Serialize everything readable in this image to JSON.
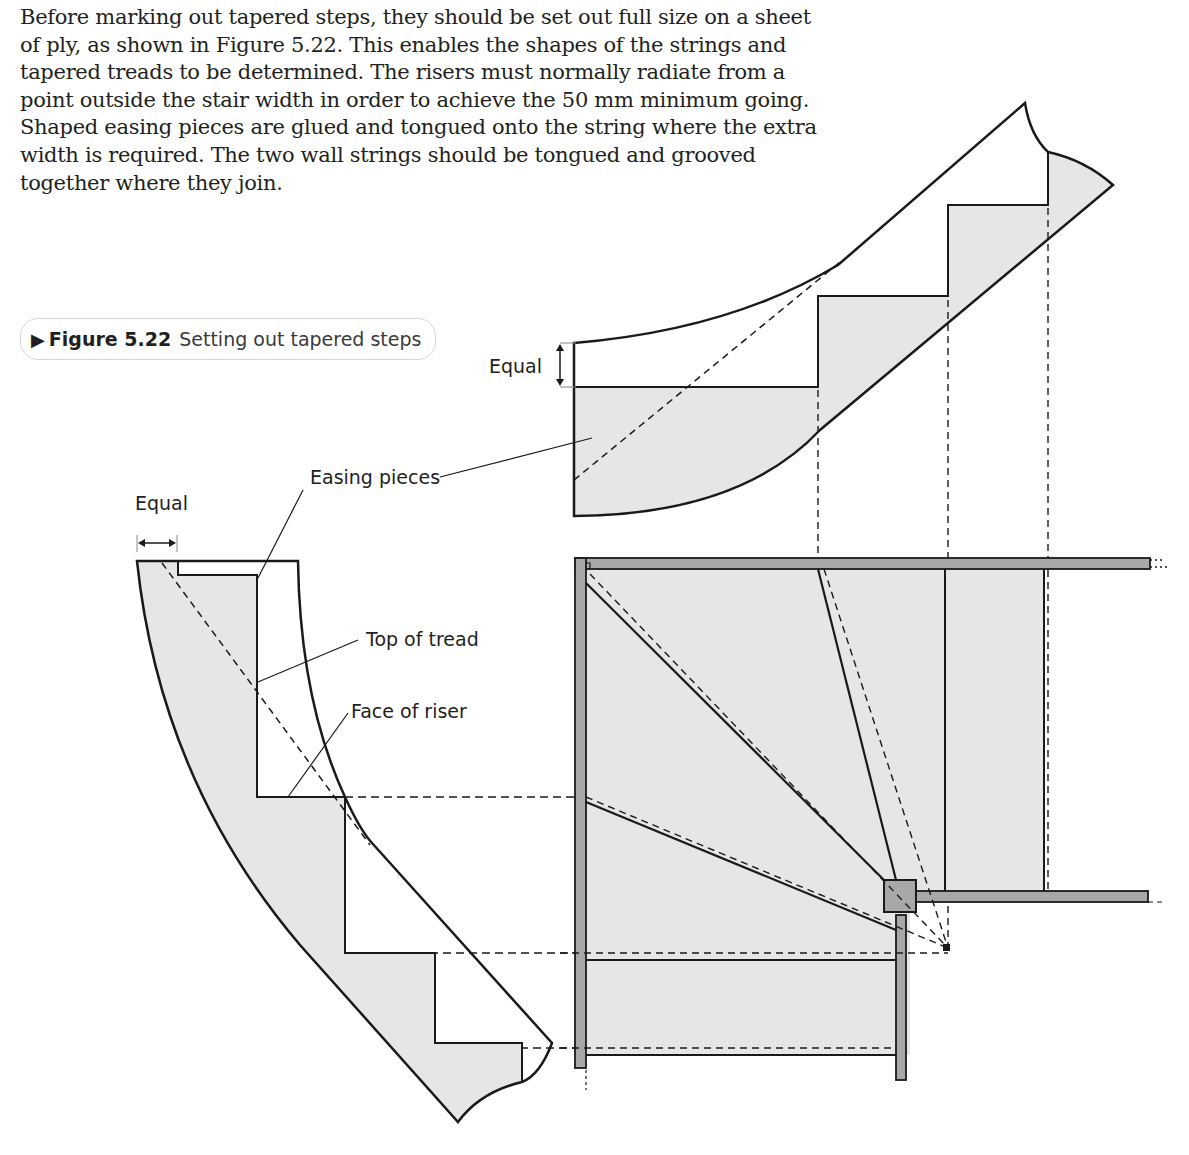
{
  "paragraph": {
    "lines": [
      "Before marking out tapered steps, they should be set out full size on a sheet",
      "of ply, as shown in Figure 5.22. This enables the shapes of the strings and",
      "tapered treads to be determined. The risers must normally radiate from a",
      "point outside the stair width in order to achieve the 50 mm minimum going.",
      "Shaped easing pieces are glued and tongued onto the string where the extra",
      "width is required. The two wall strings should be tongued and grooved",
      "together where they join."
    ]
  },
  "figure": {
    "arrow_icon": "▶",
    "number": "Figure 5.22",
    "title": "Setting out tapered steps",
    "labels": {
      "equal_top": "Equal",
      "equal_left": "Equal",
      "easing_pieces": "Easing pieces",
      "top_of_tread": "Top of tread",
      "face_of_riser": "Face of riser"
    }
  },
  "colors": {
    "fill_light": "#e6e6e6",
    "fill_wall": "#a8a8a8",
    "ink": "#1a1a1a"
  }
}
